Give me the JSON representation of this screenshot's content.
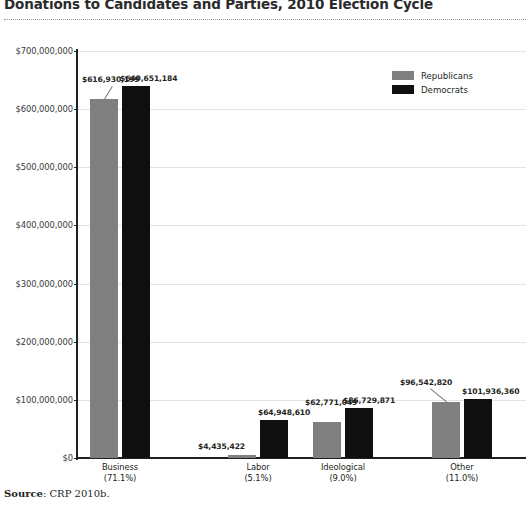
{
  "title": "Donations to Candidates and Parties, 2010 Election Cycle",
  "source": {
    "label": "Source",
    "separator": ":",
    "text": "CRP 2010b."
  },
  "legend": {
    "position": "top-right",
    "items": [
      {
        "label": "Republicans",
        "color": "#808080",
        "key": "republicans"
      },
      {
        "label": "Democrats",
        "color": "#100f10",
        "key": "democrats"
      }
    ]
  },
  "axis": {
    "y_ticks": [
      "$0",
      "$100,000,000",
      "$200,000,000",
      "$300,000,000",
      "$400,000,000",
      "$500,000,000",
      "$600,000,000",
      "$700,000,000"
    ]
  },
  "chart_data": {
    "type": "bar",
    "title": "Donations to Candidates and Parties, 2010 Election Cycle",
    "xlabel": "",
    "ylabel": "",
    "ylim": [
      0,
      700000000
    ],
    "grid": true,
    "legend_position": "top-right",
    "categories": [
      "Business",
      "Labor",
      "Ideological",
      "Other"
    ],
    "category_shares": [
      "(71.1%)",
      "(5.1%)",
      "(9.0%)",
      "(11.0%)"
    ],
    "series": [
      {
        "name": "Republicans",
        "color": "#808080",
        "values": [
          616930199,
          4435422,
          62771049,
          96542820
        ],
        "labels": [
          "$616,930,199",
          "$4,435,422",
          "$62,771,049",
          "$96,542,820"
        ]
      },
      {
        "name": "Democrats",
        "color": "#100f10",
        "values": [
          640651184,
          64948610,
          86729871,
          101936360
        ],
        "labels": [
          "$640,651,184",
          "$64,948,610",
          "$86,729,871",
          "$101,936,360"
        ]
      }
    ],
    "ytick_values": [
      0,
      100000000,
      200000000,
      300000000,
      400000000,
      500000000,
      600000000,
      700000000
    ],
    "ytick_labels": [
      "$0",
      "$100,000,000",
      "$200,000,000",
      "$300,000,000",
      "$400,000,000",
      "$500,000,000",
      "$600,000,000",
      "$700,000,000"
    ]
  }
}
